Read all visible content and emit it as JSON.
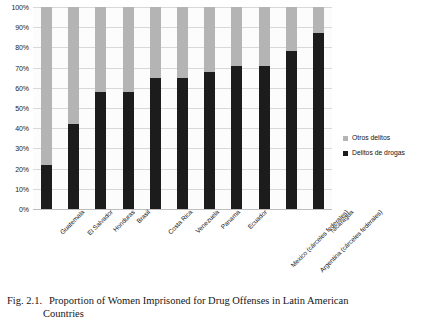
{
  "chart_data": {
    "type": "bar",
    "subtype": "stacked-percentage",
    "title": "",
    "xlabel": "",
    "ylabel": "",
    "ylim": [
      0,
      100
    ],
    "y_tick_labels": [
      "0%",
      "10%",
      "20%",
      "30%",
      "40%",
      "50%",
      "60%",
      "70%",
      "80%",
      "90%",
      "100%"
    ],
    "y_tick_values": [
      0,
      10,
      20,
      30,
      40,
      50,
      60,
      70,
      80,
      90,
      100
    ],
    "grid": true,
    "legend_position": "right",
    "categories": [
      "Guatemala",
      "El Salvador",
      "Honduras",
      "Brasil",
      "Costa Rica",
      "Venezuela",
      "Panama",
      "Ecuador",
      "Mexico (cárceles federales)",
      "Argentina (cárceles federales)",
      "Nicaragua"
    ],
    "series": [
      {
        "name": "Delitos de drogas",
        "color": "#1c1c1c",
        "values": [
          22,
          42,
          58,
          58,
          65,
          65,
          68,
          71,
          71,
          78,
          87
        ]
      },
      {
        "name": "Otros delitos",
        "color": "#b4b4b4",
        "values": [
          78,
          58,
          42,
          42,
          35,
          35,
          32,
          29,
          29,
          22,
          13
        ]
      }
    ]
  },
  "legend": {
    "items": [
      {
        "label": "Otros delitos",
        "color": "#b4b4b4"
      },
      {
        "label": "Delitos de drogas",
        "color": "#1c1c1c"
      }
    ]
  },
  "caption": {
    "figure_number": "Fig. 2.1.",
    "line1": "Proportion of Women Imprisoned for Drug Offenses in Latin American",
    "line2": "Countries"
  },
  "colors": {
    "drugs": "#1c1c1c",
    "other": "#b4b4b4",
    "grid": "#d8d8d8",
    "plot_background": "#fcfcfc",
    "text": "#111111"
  }
}
